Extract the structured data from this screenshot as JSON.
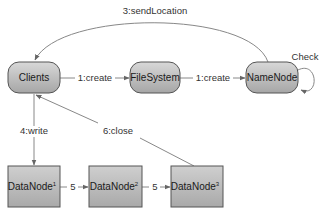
{
  "diagram": {
    "colors": {
      "node_fill_top": "#d6d6d6",
      "node_fill_bottom": "#a8a8a8",
      "node_stroke": "#555555",
      "edge": "#777777",
      "text": "#333333"
    },
    "nodes": {
      "clients": {
        "label": "Clients"
      },
      "filesystem": {
        "label": "FileSystem"
      },
      "namenode": {
        "label": "NameNode"
      },
      "datanode1": {
        "label": "DataNode",
        "sup": "1"
      },
      "datanode2": {
        "label": "DataNode",
        "sup": "2"
      },
      "datanode3": {
        "label": "DataNode",
        "sup": "3"
      }
    },
    "edges": {
      "e1": {
        "label": "1:create",
        "from": "Clients",
        "to": "FileSystem"
      },
      "e2": {
        "label": "1:create",
        "from": "FileSystem",
        "to": "NameNode"
      },
      "e3": {
        "label": "3:sendLocation",
        "from": "NameNode",
        "to": "Clients"
      },
      "e_check": {
        "label": "Check",
        "from": "NameNode",
        "to": "NameNode"
      },
      "e4": {
        "label": "4:write",
        "from": "Clients",
        "to": "DataNode1"
      },
      "e5a": {
        "label": "5",
        "from": "DataNode1",
        "to": "DataNode2"
      },
      "e5b": {
        "label": "5",
        "from": "DataNode2",
        "to": "DataNode3"
      },
      "e6": {
        "label": "6:close",
        "from": "DataNode3",
        "to": "Clients"
      }
    }
  }
}
